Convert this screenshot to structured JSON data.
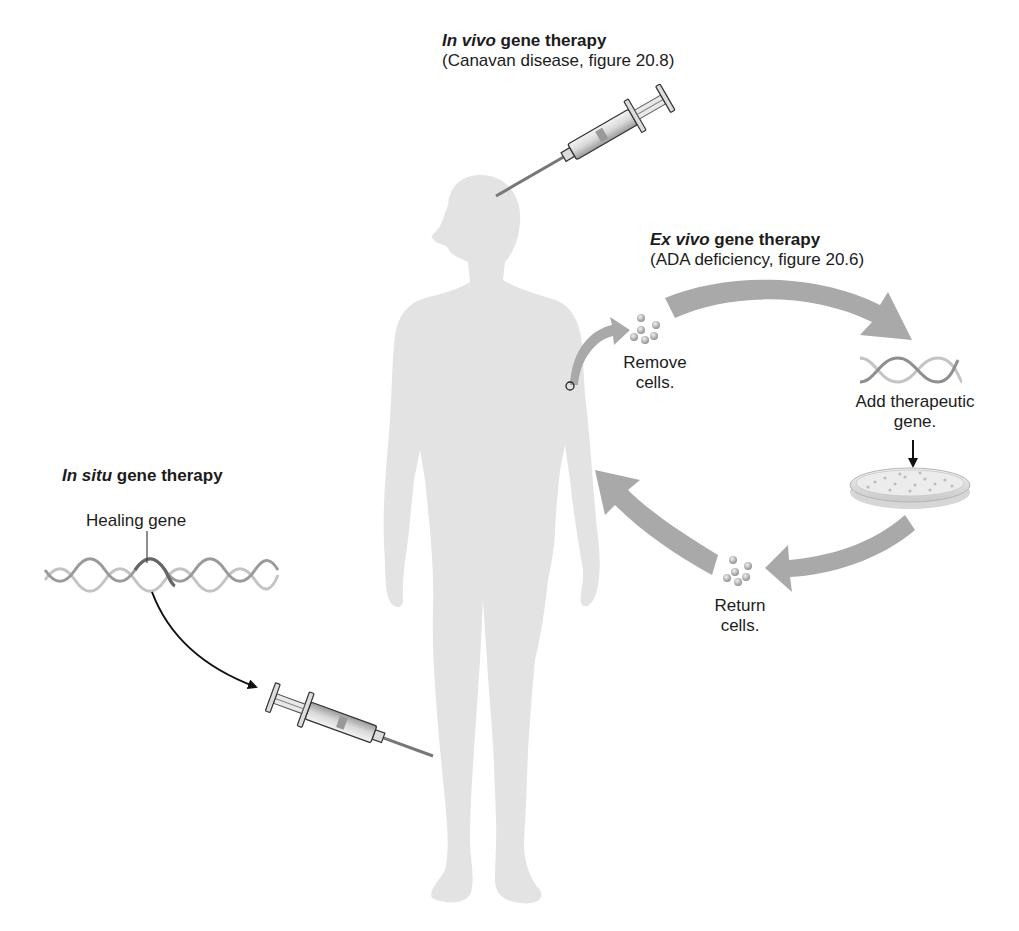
{
  "colors": {
    "body_silhouette": "#e3e3e3",
    "arrow_gray": "#a9a9a9",
    "helix_dark": "#8f8f8f",
    "helix_light": "#c4c4c4",
    "text": "#1c1c1c",
    "background": "#ffffff"
  },
  "in_vivo": {
    "title_italic": "In vivo",
    "title_rest": " gene therapy",
    "subtitle": "(Canavan disease, figure 20.8)",
    "icon": "syringe-icon"
  },
  "ex_vivo": {
    "title_italic": "Ex vivo",
    "title_rest": " gene therapy",
    "subtitle": "(ADA deficiency, figure 20.6)",
    "steps": [
      {
        "label_line1": "Remove",
        "label_line2": "cells.",
        "icon": "cells-icon"
      },
      {
        "label_line1": "Add therapeutic",
        "label_line2": "gene.",
        "icon": "dna-helix-icon"
      },
      {
        "label_line1": "",
        "label_line2": "",
        "icon": "petri-dish-icon"
      },
      {
        "label_line1": "Return",
        "label_line2": "cells.",
        "icon": "cells-icon"
      }
    ]
  },
  "in_situ": {
    "title_italic": "In situ",
    "title_rest": " gene therapy",
    "gene_label": "Healing gene",
    "icon": "syringe-icon"
  }
}
